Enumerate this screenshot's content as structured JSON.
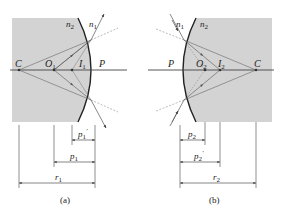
{
  "panels": [
    {
      "id": "a",
      "caption": "(a)",
      "medium_labels": {
        "inside": "n",
        "inside_sub": "2",
        "outside": "n",
        "outside_sub": "1"
      },
      "points": [
        {
          "name": "C",
          "sub": ""
        },
        {
          "name": "O",
          "sub": "1"
        },
        {
          "name": "I",
          "sub": "1"
        },
        {
          "name": "P",
          "sub": ""
        }
      ],
      "dimensions": [
        {
          "name": "p",
          "sub": "1",
          "prime": true
        },
        {
          "name": "p",
          "sub": "1",
          "prime": false
        },
        {
          "name": "r",
          "sub": "1",
          "prime": false
        }
      ]
    },
    {
      "id": "b",
      "caption": "(b)",
      "medium_labels": {
        "outside": "n",
        "outside_sub": "1",
        "inside": "n",
        "inside_sub": "2"
      },
      "points": [
        {
          "name": "P",
          "sub": ""
        },
        {
          "name": "O",
          "sub": "2"
        },
        {
          "name": "I",
          "sub": "2"
        },
        {
          "name": "C",
          "sub": ""
        }
      ],
      "dimensions": [
        {
          "name": "p",
          "sub": "2",
          "prime": false
        },
        {
          "name": "p",
          "sub": "2",
          "prime": true
        },
        {
          "name": "r",
          "sub": "2",
          "prime": false
        }
      ]
    }
  ],
  "colors": {
    "medium": "#d3d3d3",
    "line": "#333333",
    "ray": "#555555"
  }
}
